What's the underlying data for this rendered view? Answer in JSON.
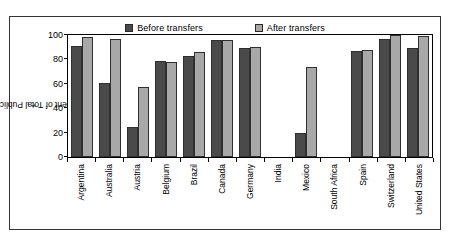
{
  "chart_data": {
    "type": "bar",
    "title": "",
    "xlabel": "",
    "ylabel": "Percent of Total Public Spending",
    "ylabel_superscript": "1",
    "ylim": [
      0,
      100
    ],
    "yticks": [
      0,
      20,
      40,
      60,
      80,
      100
    ],
    "grid": false,
    "legend_position": "top-center",
    "categories": [
      "Argentina",
      "Australia",
      "Austria",
      "Belgium",
      "Brazil",
      "Canada",
      "Germany",
      "India",
      "Mexico",
      "South Africa",
      "Spain",
      "Switzerland",
      "United States"
    ],
    "series": [
      {
        "name": "Before transfers",
        "color": "#4a4a4a",
        "values": [
          91,
          61,
          25,
          79,
          83,
          96,
          89,
          null,
          20,
          null,
          87,
          97,
          89
        ]
      },
      {
        "name": "After transfers",
        "color": "#a8a8a8",
        "values": [
          98,
          97,
          57,
          78,
          86,
          96,
          90,
          null,
          74,
          null,
          88,
          100,
          99
        ]
      }
    ]
  },
  "legend": {
    "items": [
      {
        "label": "Before transfers",
        "swatch": "legend-swatch-before"
      },
      {
        "label": "After transfers",
        "swatch": "legend-swatch-after"
      }
    ]
  }
}
